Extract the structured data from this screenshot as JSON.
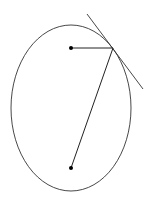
{
  "diagram": {
    "ellipse": {
      "cx": 71,
      "cy": 108,
      "rx": 60,
      "ry": 83
    },
    "foci": [
      {
        "x": 71,
        "y": 48
      },
      {
        "x": 71,
        "y": 168
      }
    ],
    "point": {
      "x": 113,
      "y": 48
    },
    "tangent": {
      "x1": 87,
      "y1": 14,
      "x2": 143,
      "y2": 89
    },
    "stroke_color": "#333333"
  }
}
